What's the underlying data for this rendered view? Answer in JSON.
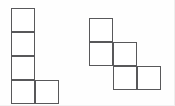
{
  "canvas": {
    "width": 175,
    "height": 106,
    "background_color": "#fefefe",
    "stroke_color": "#58585a",
    "fill_color": "#ffffff",
    "stroke_width": 1,
    "cell_size": 24
  },
  "figure": {
    "shape_count": 2,
    "shapes": [
      {
        "name": "left-shape",
        "label": "L-pentomino",
        "origin_x": 11,
        "origin_y": 8,
        "cell_count": 5,
        "grid_cols": 2,
        "grid_rows": 4,
        "cells": [
          {
            "col": 0,
            "row": 0
          },
          {
            "col": 0,
            "row": 1
          },
          {
            "col": 0,
            "row": 2
          },
          {
            "col": 0,
            "row": 3
          },
          {
            "col": 1,
            "row": 3
          }
        ]
      },
      {
        "name": "right-shape",
        "label": "W-pentomino",
        "origin_x": 89,
        "origin_y": 18,
        "cell_count": 5,
        "grid_cols": 3,
        "grid_rows": 3,
        "cells": [
          {
            "col": 0,
            "row": 0
          },
          {
            "col": 0,
            "row": 1
          },
          {
            "col": 1,
            "row": 1
          },
          {
            "col": 1,
            "row": 2
          },
          {
            "col": 2,
            "row": 2
          }
        ]
      }
    ]
  }
}
